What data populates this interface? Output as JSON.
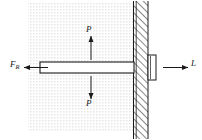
{
  "figure": {
    "type": "engineering-free-body-diagram",
    "background_color": "#ffffff",
    "stipple_color": "#e8e8e8",
    "line_color": "#1a1a1a",
    "hatch_color": "#2b2b2b"
  },
  "labels": {
    "reaction_force": "F",
    "reaction_force_subscript": "R",
    "load_top": "P",
    "load_bottom": "P",
    "length": "L"
  },
  "arrows": {
    "reaction_force": {
      "direction": "left",
      "from_x": 48,
      "from_y": 67,
      "to_x": 23,
      "to_y": 67
    },
    "load_top": {
      "direction": "up",
      "from_x": 91,
      "from_y": 62,
      "to_x": 91,
      "to_y": 36
    },
    "load_bottom": {
      "direction": "down",
      "from_x": 91,
      "from_y": 74,
      "to_x": 91,
      "to_y": 99
    },
    "length": {
      "direction": "right",
      "from_x": 163,
      "from_y": 67,
      "to_x": 188,
      "to_y": 67
    }
  },
  "geometry": {
    "bar": {
      "x": 40,
      "y": 62,
      "width": 94,
      "height": 11
    },
    "wall": {
      "x": 133,
      "y": 1,
      "width": 15,
      "height": 138
    },
    "wall_plate": {
      "x": 148,
      "y": 55,
      "width": 8,
      "height": 25
    },
    "stipple_region": {
      "x": 28,
      "y": 2,
      "width": 106,
      "height": 130
    }
  }
}
